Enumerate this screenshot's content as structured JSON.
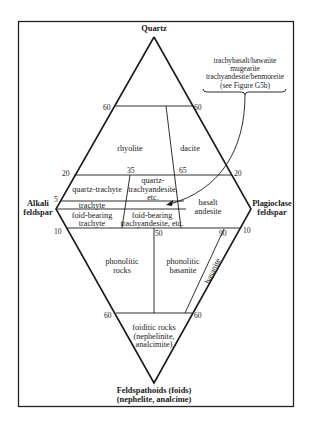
{
  "diagram": {
    "type": "QAPF double-triangle classification diagram (volcanic rocks)",
    "apices": {
      "top": "Quartz",
      "left": [
        "Alkali",
        "feldspar"
      ],
      "right": [
        "Plagioclase",
        "feldspar"
      ],
      "bottom": [
        "Feldspathoids (foids)",
        "(nephelite, analcime)"
      ]
    },
    "ticks": {
      "q60_left": "60",
      "q60_right": "60",
      "q20_left": "20",
      "q20_right": "20",
      "q20_35": "35",
      "q20_65": "65",
      "q5_left": "5",
      "f10_left": "10",
      "f10_right": "10",
      "f10_50": "50",
      "f10_90": "90",
      "f60_left": "60",
      "f60_right": "60"
    },
    "fields": {
      "rhyolite": "rhyolite",
      "dacite": "dacite",
      "quartz_trachyte": "quartz-trachyte",
      "quartz_trachyandesite": [
        "quartz-",
        "trachyandesite,",
        "etc."
      ],
      "trachyte": "trachyte",
      "foid_bearing_trachyte": [
        "foid-bearing",
        "trachyte"
      ],
      "foid_bearing_trachyandesite": [
        "foid-bearing",
        "trachyandesite, etc."
      ],
      "basalt_andesite": [
        "basalt",
        "andesite"
      ],
      "phonolitic_rocks": [
        "phonolitic",
        "rocks"
      ],
      "phonolitic_basanite": [
        "phonolitic",
        "basanite"
      ],
      "basanite": "basanite",
      "foiditic_rocks": [
        "foiditic rocks",
        "(nephelinite,",
        "analcimite)"
      ]
    },
    "annotation": {
      "lines": [
        "trachybasalt/hawaiite",
        "mugearite",
        "trachyandesite/benmoreite",
        "(see Figure G5b)"
      ]
    },
    "colors": {
      "line": "#1a1a1a",
      "frame": "#222222",
      "background": "#ffffff"
    }
  }
}
